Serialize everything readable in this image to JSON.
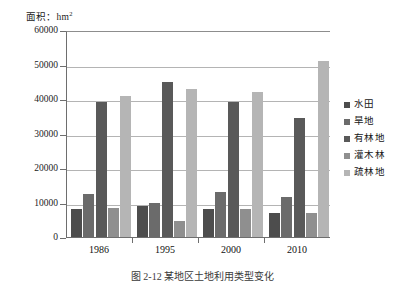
{
  "figure": {
    "y_unit_label": "面积：hm",
    "y_unit_superscript": "2",
    "caption": "图 2-12  某地区土地利用类型变化"
  },
  "legend": {
    "position": "right",
    "items": [
      {
        "label": "水田",
        "color": "#4d4d4d"
      },
      {
        "label": "旱地",
        "color": "#6b6b6b"
      },
      {
        "label": "有林地",
        "color": "#595959"
      },
      {
        "label": "灌木林",
        "color": "#8f8f8f"
      },
      {
        "label": "疏林地",
        "color": "#b5b5b5"
      }
    ]
  },
  "chart_data": {
    "type": "bar",
    "title": "",
    "xlabel": "",
    "ylabel": "面积：hm2",
    "ylim": [
      0,
      60000
    ],
    "ytick_labels": [
      "60000",
      "50000",
      "40000",
      "30000",
      "20000",
      "10000",
      "0"
    ],
    "ytick_values": [
      60000,
      50000,
      40000,
      30000,
      20000,
      10000,
      0
    ],
    "grid": true,
    "legend_position": "right",
    "categories": [
      "1986",
      "1995",
      "2000",
      "2010"
    ],
    "series": [
      {
        "name": "水田",
        "color": "#4d4d4d",
        "values": [
          8000,
          9000,
          8000,
          7000
        ]
      },
      {
        "name": "旱地",
        "color": "#6b6b6b",
        "values": [
          12500,
          10000,
          13000,
          11500
        ]
      },
      {
        "name": "有林地",
        "color": "#595959",
        "values": [
          39000,
          45000,
          39000,
          34500
        ]
      },
      {
        "name": "灌木林",
        "color": "#8f8f8f",
        "values": [
          8500,
          4500,
          8000,
          7000
        ]
      },
      {
        "name": "疏林地",
        "color": "#b5b5b5",
        "values": [
          41000,
          43000,
          42000,
          51000
        ]
      }
    ]
  }
}
